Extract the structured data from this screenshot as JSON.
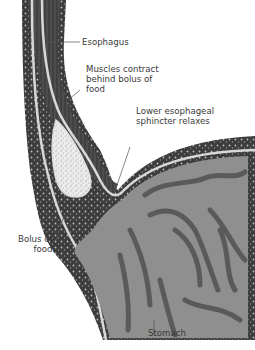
{
  "figure": {
    "colors": {
      "muscle_wall": "#4a4a4a",
      "wall_dark": "#2e2e2e",
      "lining_light": "#d8d8d8",
      "stomach_interior": "#8f8f8f",
      "rugae": "#5a5a5a",
      "bolus": "#e6e6e6",
      "background": "#ffffff",
      "label_text": "#3a3a3a",
      "leader_line": "#555555"
    }
  },
  "labels": {
    "esophagus": "Esophagus",
    "muscles_contract": "Muscles contract\nbehind bolus of\nfood",
    "sphincter": "Lower esophageal\nsphincter relaxes",
    "bolus": "Bolus of\nfood",
    "stomach": "Stomach"
  }
}
